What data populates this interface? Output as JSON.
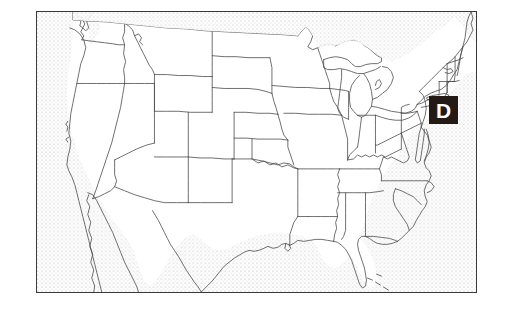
{
  "figure": {
    "kind": "map",
    "title": "Map of the contiguous United States with state outlines",
    "region": "Contiguous United States",
    "projection_note": "outline map, state borders shown",
    "frame": {
      "border_color": "#3a3a3a",
      "background_color": "#ffffff",
      "x": 36,
      "y": 11,
      "width": 441,
      "height": 282
    },
    "ocean": {
      "fill_style": "stipple-dots",
      "dot_color": "#9a9a9a",
      "description": "Surrounding ocean and non-US land shown as light dotted stipple"
    },
    "land": {
      "fill_color": "#ffffff",
      "outline_color": "#4a4a4a"
    }
  },
  "marker": {
    "letter": "D",
    "box_color": "#231a16",
    "text_color": "#ffffff",
    "placement": "Northeast coast, over New Jersey / New York Bight",
    "x": 428,
    "y": 95,
    "width": 29,
    "height": 28
  },
  "map_features": {
    "visible_states": [
      "Washington",
      "Oregon",
      "California",
      "Idaho",
      "Nevada",
      "Montana",
      "Wyoming",
      "Utah",
      "Arizona",
      "Colorado",
      "New Mexico",
      "North Dakota",
      "South Dakota",
      "Nebraska",
      "Kansas",
      "Oklahoma",
      "Texas",
      "Minnesota",
      "Iowa",
      "Missouri",
      "Arkansas",
      "Louisiana",
      "Wisconsin",
      "Illinois",
      "Michigan",
      "Indiana",
      "Ohio",
      "Kentucky",
      "Tennessee",
      "Mississippi",
      "Alabama",
      "Georgia",
      "Florida",
      "South Carolina",
      "North Carolina",
      "Virginia",
      "West Virginia",
      "Maryland",
      "Delaware",
      "Pennsylvania",
      "New Jersey",
      "New York",
      "Connecticut",
      "Rhode Island",
      "Massachusetts",
      "Vermont",
      "New Hampshire",
      "Maine"
    ],
    "water_bodies": [
      "Pacific Ocean",
      "Atlantic Ocean",
      "Gulf of Mexico",
      "Lake Superior",
      "Lake Michigan",
      "Lake Huron",
      "Lake Erie",
      "Lake Ontario"
    ],
    "other": [
      "Florida Keys",
      "Long Island",
      "Chesapeake Bay",
      "Cape Cod"
    ]
  }
}
